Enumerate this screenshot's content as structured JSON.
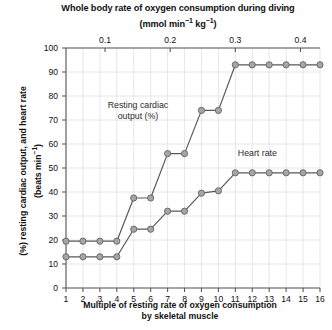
{
  "chart_data": {
    "type": "line",
    "title_line1": "Whole body rate of oxygen consumption during diving",
    "title_line2": "(mmol min⁻¹ kg⁻¹)",
    "xlabel": "Multiple of resting rate of oxygen consumption by skeletal muscle",
    "xlabel_line1": "Multiple of resting rate of oxygen consumption",
    "xlabel_line2": "by skeletal muscle",
    "ylabel": "(%) resting cardiac output, and heart rate (beats min⁻¹)",
    "ylabel_line1": "(%) resting cardiac output, and heart rate",
    "ylabel_line2": "(beats min⁻¹)",
    "secondary_xlabel": "Whole body rate of oxygen consumption during diving (mmol min⁻¹ kg⁻¹)",
    "x": [
      1,
      2,
      3,
      4,
      5,
      6,
      7,
      8,
      9,
      10,
      11,
      12,
      13,
      14,
      15,
      16
    ],
    "xlim": [
      1,
      16
    ],
    "ylim": [
      0,
      100
    ],
    "xticks": [
      "1",
      "2",
      "3",
      "4",
      "5",
      "6",
      "7",
      "8",
      "9",
      "10",
      "11",
      "12",
      "13",
      "14",
      "15",
      "16"
    ],
    "yticks": [
      "0",
      "10",
      "20",
      "30",
      "40",
      "50",
      "60",
      "70",
      "80",
      "90",
      "100"
    ],
    "secondary_xticks": [
      {
        "label": "0.1",
        "value": 0.1
      },
      {
        "label": "0.2",
        "value": 0.2
      },
      {
        "label": "0.3",
        "value": 0.3
      },
      {
        "label": "0.4",
        "value": 0.4
      }
    ],
    "secondary_xlim": [
      0.04,
      0.43
    ],
    "grid": true,
    "legend_position": "inline-annotations",
    "series": [
      {
        "name": "Resting cardiac output (%)",
        "annotation_line1": "Resting cardiac",
        "annotation_line2": "output (%)",
        "values": [
          19.5,
          19.5,
          19.5,
          19.5,
          37.5,
          37.5,
          56,
          56,
          74,
          74,
          93,
          93,
          93,
          93,
          93,
          93
        ]
      },
      {
        "name": "Heart rate",
        "annotation_line1": "Heart rate",
        "annotation_line2": "",
        "values": [
          13,
          13,
          13,
          13,
          24.5,
          24.5,
          32,
          32,
          39.5,
          40.5,
          48,
          48,
          48,
          48,
          48,
          48
        ]
      }
    ],
    "colors": {
      "line": "#595959",
      "marker_fill": "#a6a6a6",
      "marker_stroke": "#6b6b6b",
      "axis": "#595959",
      "grid": "#e6e6ec",
      "text": "#111111"
    }
  }
}
